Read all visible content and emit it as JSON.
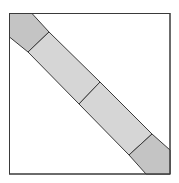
{
  "diagram": {
    "colors": {
      "background": "#ffffff",
      "outline": "#3a3a3a",
      "end_segment_fill": "#c4c4c4",
      "middle_segment_fill": "#d6d6d6"
    },
    "segments": 4
  }
}
